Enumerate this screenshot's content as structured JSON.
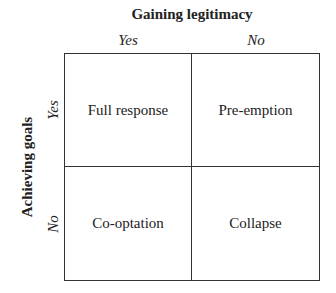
{
  "diagram": {
    "column_axis_title": "Gaining legitimacy",
    "row_axis_title": "Achieving goals",
    "columns": [
      "Yes",
      "No"
    ],
    "rows": [
      "Yes",
      "No"
    ],
    "cells": [
      [
        "Full response",
        "Pre-emption"
      ],
      [
        "Co-optation",
        "Collapse"
      ]
    ]
  }
}
